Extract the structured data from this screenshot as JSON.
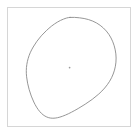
{
  "panel": {
    "width": 140,
    "height": 137,
    "background_color": "#ffffff",
    "label": "shape outline panel"
  },
  "frame": {
    "label": "Plot frame",
    "x": 7,
    "y": 7,
    "width": 124,
    "height": 120,
    "border_color": "#d6d6d6",
    "border_width": 1,
    "fill_color": "#ffffff"
  },
  "chart_data": {
    "type": "line",
    "title": "",
    "subtitle": "",
    "xlabel": "",
    "ylabel": "",
    "grid": false,
    "legend_position": "none",
    "axis_ticks": [],
    "tick_labels": [],
    "annotations": [],
    "xlim": [
      7,
      131
    ],
    "ylim": [
      7,
      127
    ],
    "series": [
      {
        "name": "closed-blob-outline",
        "closed": true,
        "stroke_color": "#8a8a8a",
        "stroke_width": 0.9,
        "fill": "none",
        "points": [
          [
            70.0,
            17.4
          ],
          [
            79.5,
            17.8
          ],
          [
            88.6,
            19.6
          ],
          [
            96.6,
            23.0
          ],
          [
            103.4,
            28.0
          ],
          [
            108.9,
            34.4
          ],
          [
            112.8,
            41.8
          ],
          [
            115.2,
            49.8
          ],
          [
            116.1,
            58.0
          ],
          [
            115.4,
            66.2
          ],
          [
            113.2,
            74.0
          ],
          [
            109.6,
            81.3
          ],
          [
            104.7,
            88.0
          ],
          [
            98.8,
            94.0
          ],
          [
            92.2,
            99.4
          ],
          [
            85.2,
            104.2
          ],
          [
            78.2,
            108.5
          ],
          [
            71.5,
            112.2
          ],
          [
            65.4,
            115.1
          ],
          [
            59.9,
            117.1
          ],
          [
            55.1,
            118.1
          ],
          [
            50.8,
            118.1
          ],
          [
            46.8,
            117.0
          ],
          [
            43.1,
            114.8
          ],
          [
            39.7,
            111.5
          ],
          [
            36.6,
            107.2
          ],
          [
            33.8,
            102.0
          ],
          [
            31.3,
            96.1
          ],
          [
            29.2,
            89.7
          ],
          [
            27.6,
            83.2
          ],
          [
            26.6,
            76.8
          ],
          [
            26.3,
            70.6
          ],
          [
            26.8,
            64.6
          ],
          [
            28.1,
            58.7
          ],
          [
            30.2,
            52.8
          ],
          [
            33.2,
            47.0
          ],
          [
            36.9,
            41.3
          ],
          [
            41.3,
            35.8
          ],
          [
            46.3,
            30.7
          ],
          [
            51.7,
            26.0
          ],
          [
            57.4,
            22.1
          ],
          [
            63.5,
            19.1
          ]
        ]
      }
    ],
    "markers": [
      {
        "name": "center-marker",
        "x": 69.6,
        "y": 67.6,
        "radius": 0.85,
        "color": "#9a9a9a",
        "shape": "dot"
      }
    ]
  }
}
